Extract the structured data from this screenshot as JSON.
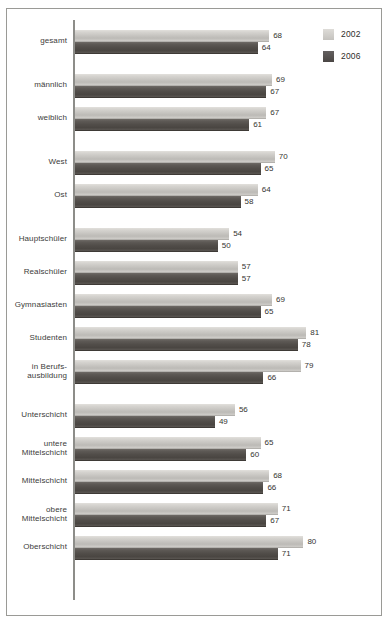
{
  "legend": {
    "position": "top-right",
    "entries": [
      {
        "label": "2002",
        "color": "#c8c6c2",
        "key": "y2002"
      },
      {
        "label": "2006",
        "color": "#524e4a",
        "key": "y2006"
      }
    ]
  },
  "colors": {
    "series_2002": "#c8c6c2",
    "series_2006": "#524e4a",
    "frame_border": "#9a9a96",
    "axis": "#8d8d89",
    "text": "#34332f",
    "background": "#ffffff"
  },
  "chart_data": {
    "type": "bar",
    "orientation": "horizontal",
    "title": "",
    "subtitle": "",
    "xlabel": "",
    "ylabel": "",
    "xlim": [
      0,
      90
    ],
    "grid": false,
    "legend_position": "top-right",
    "categories": [
      "gesamt",
      "männlich",
      "weiblich",
      "West",
      "Ost",
      "Hauptschüler",
      "Realschüler",
      "Gymnasiasten",
      "Studenten",
      "in Berufs-\nausbildung",
      "Unterschicht",
      "untere\nMittelschicht",
      "Mittelschicht",
      "obere\nMittelschicht",
      "Oberschicht"
    ],
    "category_lines": [
      [
        "gesamt"
      ],
      [
        "männlich"
      ],
      [
        "weiblich"
      ],
      [
        "West"
      ],
      [
        "Ost"
      ],
      [
        "Hauptschüler"
      ],
      [
        "Realschüler"
      ],
      [
        "Gymnasiasten"
      ],
      [
        "Studenten"
      ],
      [
        "in Berufs-",
        "ausbildung"
      ],
      [
        "Unterschicht"
      ],
      [
        "untere",
        "Mittelschicht"
      ],
      [
        "Mittelschicht"
      ],
      [
        "obere",
        "Mittelschicht"
      ],
      [
        "Oberschicht"
      ]
    ],
    "series": [
      {
        "name": "2002",
        "values": [
          68,
          69,
          67,
          70,
          64,
          54,
          57,
          69,
          81,
          79,
          56,
          65,
          68,
          71,
          80
        ]
      },
      {
        "name": "2006",
        "values": [
          64,
          67,
          61,
          65,
          58,
          50,
          57,
          65,
          78,
          66,
          49,
          60,
          66,
          67,
          71
        ]
      }
    ],
    "groups": [
      {
        "name": "total",
        "categories": [
          "gesamt"
        ]
      },
      {
        "name": "gender",
        "categories": [
          "männlich",
          "weiblich"
        ]
      },
      {
        "name": "region",
        "categories": [
          "West",
          "Ost"
        ]
      },
      {
        "name": "education",
        "categories": [
          "Hauptschüler",
          "Realschüler",
          "Gymnasiasten",
          "Studenten",
          "in Berufs-\nausbildung"
        ]
      },
      {
        "name": "social-class",
        "categories": [
          "Unterschicht",
          "untere\nMittelschicht",
          "Mittelschicht",
          "obere\nMittelschicht",
          "Oberschicht"
        ]
      }
    ]
  }
}
